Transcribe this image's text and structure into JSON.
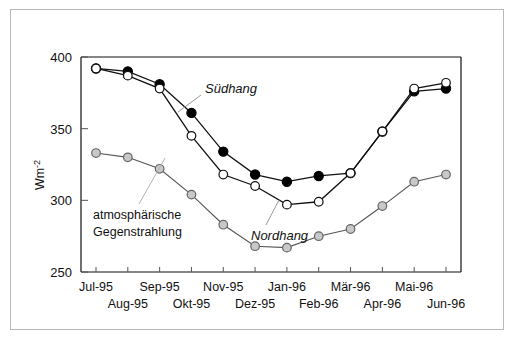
{
  "figure": {
    "frame_color": "#b9b9b9",
    "background": "#ffffff"
  },
  "axis": {
    "y_title_main": "Wm",
    "y_title_sup": "-2",
    "y_ticks": [
      "250",
      "300",
      "350",
      "400"
    ],
    "y_min": 250,
    "y_max": 400,
    "x_labels_top": [
      "Jul-95",
      "Sep-95",
      "Nov-95",
      "Jan-96",
      "Mär-96",
      "Mai-96"
    ],
    "x_labels_bottom": [
      "Aug-95",
      "Okt-95",
      "Dez-95",
      "Feb-96",
      "Apr-96",
      "Jun-96"
    ]
  },
  "annotations": {
    "suedhang": "Südhang",
    "nordhang": "Nordhang",
    "atmos_line1": "atmosphärische",
    "atmos_line2": "Gegenstrahlung"
  },
  "chart_data": {
    "type": "line",
    "title": "",
    "xlabel": "",
    "ylabel": "Wm-2",
    "ylim": [
      250,
      400
    ],
    "grid": false,
    "legend": "annotated-inline",
    "categories": [
      "Jul-95",
      "Aug-95",
      "Sep-95",
      "Okt-95",
      "Nov-95",
      "Dez-95",
      "Jan-96",
      "Feb-96",
      "Mär-96",
      "Apr-96",
      "Mai-96",
      "Jun-96"
    ],
    "series": [
      {
        "name": "Südhang",
        "marker": "filled-circle",
        "color": "#000000",
        "values": [
          392,
          390,
          381,
          361,
          334,
          318,
          313,
          317,
          319,
          348,
          376,
          378
        ]
      },
      {
        "name": "Nordhang",
        "marker": "open-circle",
        "color": "#ffffff",
        "values": [
          392,
          387,
          378,
          345,
          318,
          310,
          297,
          299,
          319,
          348,
          378,
          382
        ]
      },
      {
        "name": "atmosphärische Gegenstrahlung",
        "marker": "gray-circle",
        "color": "#c8c8c8",
        "values": [
          333,
          330,
          322,
          304,
          283,
          268,
          267,
          275,
          280,
          296,
          313,
          318
        ]
      }
    ]
  }
}
